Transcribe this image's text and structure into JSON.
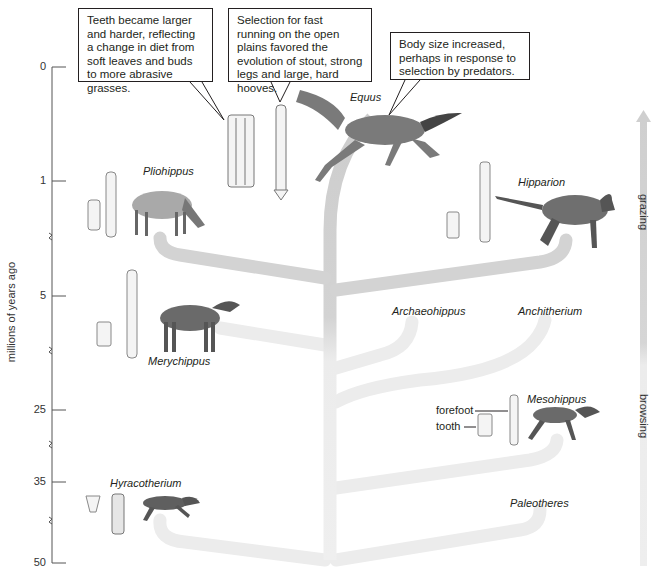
{
  "callouts": [
    {
      "id": "teeth",
      "text": "Teeth became larger and harder, reflecting a change in diet from soft leaves and buds to more abrasive grasses."
    },
    {
      "id": "legs",
      "text": "Selection for fast running on the open plains favored the evolution of stout, strong legs and large, hard hooves."
    },
    {
      "id": "body",
      "text": "Body size increased, perhaps in response to selection by predators."
    }
  ],
  "axis": {
    "title": "millions of years ago",
    "ticks": [
      "0",
      "1",
      "5",
      "25",
      "35",
      "50"
    ]
  },
  "genera": {
    "equus": "Equus",
    "pliohippus": "Pliohippus",
    "hipparion": "Hipparion",
    "merychippus": "Merychippus",
    "archaeohippus": "Archaeohippus",
    "anchitherium": "Anchitherium",
    "mesohippus": "Mesohippus",
    "hyracotherium": "Hyracotherium",
    "paleotheres": "Paleotheres"
  },
  "part_labels": {
    "forefoot": "forefoot",
    "tooth": "tooth"
  },
  "diet_arrow": {
    "top": "grazing",
    "bottom": "browsing"
  },
  "colors": {
    "branch_light": "#e9e9e9",
    "branch_dark": "#cfcfcf",
    "axis": "#555555",
    "animal": "#6b6b6b"
  }
}
